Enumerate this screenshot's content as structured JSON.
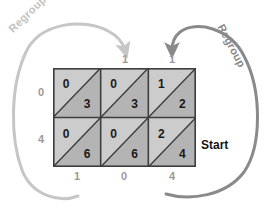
{
  "diagram": {
    "title_visible": false,
    "colors": {
      "grid_border": "#3d3d3d",
      "cell_upper_fill": "#cccccc",
      "cell_lower_fill": "#b4b4b4",
      "digit_color": "#1a1a1a",
      "edge_label_color": "#9a9a9a",
      "arrow_left_color": "#c6c6c6",
      "arrow_right_color": "#8a8a8a",
      "start_color": "#141414"
    },
    "grid": {
      "columns": 3,
      "rows": 2,
      "cells": [
        [
          {
            "upper": "0",
            "lower": "3"
          },
          {
            "upper": "0",
            "lower": "3"
          },
          {
            "upper": "1",
            "lower": "2"
          }
        ],
        [
          {
            "upper": "0",
            "lower": "6"
          },
          {
            "upper": "0",
            "lower": "6"
          },
          {
            "upper": "2",
            "lower": "4"
          }
        ]
      ]
    },
    "top_labels": [
      {
        "text": "1",
        "x": 125
      },
      {
        "text": "1",
        "x": 172
      }
    ],
    "left_labels": [
      {
        "text": "0",
        "y": 93
      },
      {
        "text": "4",
        "y": 140
      }
    ],
    "bottom_labels": [
      {
        "text": "1",
        "x": 77
      },
      {
        "text": "0",
        "x": 124
      },
      {
        "text": "4",
        "x": 172
      }
    ],
    "start_label": "Start",
    "regroup_left_label": "Regroup",
    "regroup_right_label": "Regroup"
  }
}
